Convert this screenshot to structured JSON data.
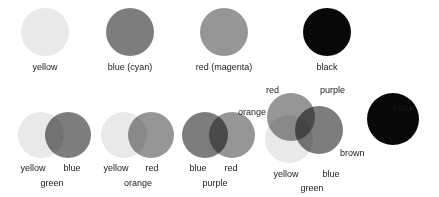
{
  "figure": {
    "background": "#ffffff",
    "text_color": "#1a1a1a"
  },
  "palette": {
    "yellow": "#e9e9e9",
    "cyan": "#7d7d7d",
    "magenta": "#969696",
    "black": "#080808",
    "green": "#5a5a5a",
    "orange": "#8a8a8a",
    "purple": "#3a3a3a",
    "brown": "#2a2a2a"
  },
  "primaries": {
    "items": [
      {
        "label": "yellow",
        "color": "#e9e9e9",
        "cx": 45,
        "cy": 32,
        "r": 24
      },
      {
        "label": "blue (cyan)",
        "color": "#7d7d7d",
        "cx": 130,
        "cy": 32,
        "r": 24
      },
      {
        "label": "red (magenta)",
        "color": "#969696",
        "cx": 224,
        "cy": 32,
        "r": 24
      },
      {
        "label": "black",
        "color": "#080808",
        "cx": 327,
        "cy": 32,
        "r": 24
      }
    ]
  },
  "pairs": [
    {
      "name": "yellow-blue-green",
      "left_label": "yellow",
      "right_label": "blue",
      "result_label": "green",
      "left_color": "#e9e9e9",
      "right_color": "#7d7d7d",
      "result_color": "#5a5a5a"
    },
    {
      "name": "yellow-red-orange",
      "left_label": "yellow",
      "right_label": "red",
      "result_label": "orange",
      "left_color": "#e9e9e9",
      "right_color": "#969696",
      "result_color": "#8a8a8a"
    },
    {
      "name": "blue-red-purple",
      "left_label": "blue",
      "right_label": "red",
      "result_label": "purple",
      "left_color": "#7d7d7d",
      "right_color": "#969696",
      "result_color": "#3a3a3a"
    }
  ],
  "triple": {
    "name": "yellow-blue-red-brown",
    "labels": {
      "red": "red",
      "purple": "purple",
      "orange": "orange",
      "brown": "brown",
      "yellow": "yellow",
      "blue": "blue",
      "green": "green"
    },
    "colors": {
      "red": "#969696",
      "blue": "#7d7d7d",
      "yellow": "#e9e9e9"
    }
  },
  "black_swatch": {
    "label": "black",
    "color": "#080808"
  }
}
